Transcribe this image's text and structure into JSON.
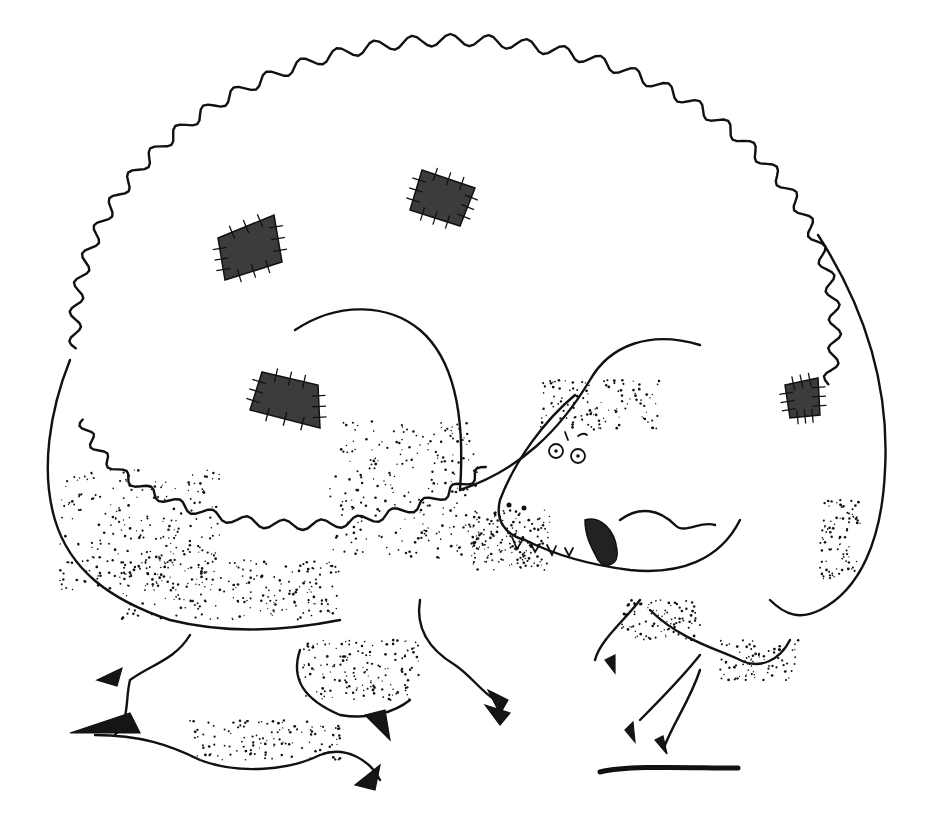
{
  "image": {
    "title": "Pen-and-ink drawing of a patched dinosaur",
    "description": "A hunched tyrannosaur-like dinosaur with a scalloped, crest-edged body covered in four dark stitched patches, glaring eyes, toothy open mouth with stippled tongue, clawed feet and small ground shadow.",
    "colors": {
      "ink": "#111111",
      "patch": "#3c3c3c",
      "paper": "#ffffff"
    },
    "elements": {
      "patches": 5,
      "eyes": 2,
      "feet_visible": 3
    }
  }
}
